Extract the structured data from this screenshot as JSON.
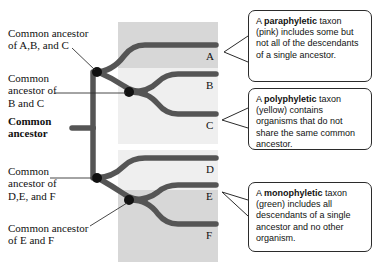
{
  "figure": {
    "type": "phylogenetic-tree-diagram",
    "taxa": [
      "A",
      "B",
      "C",
      "D",
      "E",
      "F"
    ]
  },
  "tree": {
    "nodes": [
      {
        "id": "common-ancestor",
        "label": "Common\nancestor",
        "bold": true
      },
      {
        "id": "ancestor-abc",
        "label": "Common ancestor\nof A,B, and C",
        "bold": false
      },
      {
        "id": "ancestor-bc",
        "label": "Common\nancestor of\nB and C",
        "bold": false
      },
      {
        "id": "ancestor-def",
        "label": "Common\nancestor of\nD,E, and F",
        "bold": false
      },
      {
        "id": "ancestor-ef",
        "label": "Common ancestor\nof E and F",
        "bold": false
      }
    ],
    "tips": [
      {
        "letter": "A"
      },
      {
        "letter": "B"
      },
      {
        "letter": "C"
      },
      {
        "letter": "D"
      },
      {
        "letter": "E"
      },
      {
        "letter": "F"
      }
    ]
  },
  "groups": [
    {
      "id": "paraphyletic",
      "shade": "dark",
      "covers": [
        "A"
      ]
    },
    {
      "id": "polyphyletic",
      "shade": "light",
      "covers": [
        "B",
        "C"
      ]
    },
    {
      "id": "polyphyletic-d",
      "shade": "light",
      "covers": [
        "D"
      ]
    },
    {
      "id": "monophyletic",
      "shade": "dark",
      "covers": [
        "E",
        "F"
      ]
    }
  ],
  "callouts": [
    {
      "id": "paraphyletic",
      "term": "paraphyletic",
      "lead": "A ",
      "rest": " taxon (pink) includes some but not all of the descendants of a single ancestor."
    },
    {
      "id": "polyphyletic",
      "term": "polyphyletic",
      "lead": "A ",
      "rest": " taxon (yellow) contains organisms that do not share the same common ancestor."
    },
    {
      "id": "monophyletic",
      "term": "monophyletic",
      "lead": "A ",
      "rest": " taxon (green) includes all descendants of a single ancestor and no other organism."
    }
  ],
  "colors": {
    "branch": "#555555",
    "node_dot": "#111111",
    "band_dark": "#d7d7d7",
    "band_light": "#efefef",
    "callout_border": "#2b2b2b",
    "text": "#111111"
  }
}
